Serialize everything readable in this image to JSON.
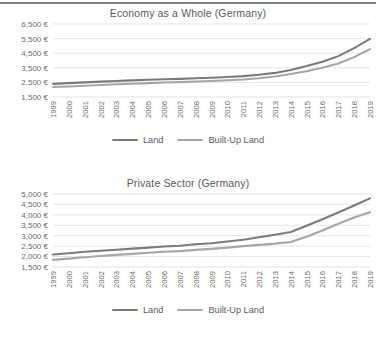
{
  "page": {
    "background": "#ffffff",
    "text_color": "#595959"
  },
  "colors": {
    "land": "#7b7b7b",
    "built_up_land": "#a6a6a6",
    "gridline": "#d9d9d9",
    "axis_text": "#6b6b6b",
    "rule": "#6f6f6f"
  },
  "charts": [
    {
      "id": "economy-as-a-whole",
      "title": "Economy as a Whole (Germany)",
      "legend": [
        {
          "label": "Land",
          "color": "#7b7b7b"
        },
        {
          "label": "Built-Up Land",
          "color": "#a6a6a6"
        }
      ]
    },
    {
      "id": "private-sector",
      "title": "Private Sector (Germany)",
      "legend": [
        {
          "label": "Land",
          "color": "#7b7b7b"
        },
        {
          "label": "Built-Up Land",
          "color": "#a6a6a6"
        }
      ]
    }
  ],
  "chart_data": [
    {
      "type": "line",
      "title": "Economy as a Whole (Germany)",
      "xlabel": "",
      "ylabel": "",
      "grid": true,
      "legend_position": "bottom",
      "ylim": [
        1500,
        6500
      ],
      "ytick_step": 1000,
      "ytick_labels": [
        "1,500 €",
        "2,500 €",
        "3,500 €",
        "4,500 €",
        "5,500 €",
        "6,500 €"
      ],
      "yticks": [
        1500,
        2500,
        3500,
        4500,
        5500,
        6500
      ],
      "categories": [
        1999,
        2000,
        2001,
        2002,
        2003,
        2004,
        2005,
        2006,
        2007,
        2008,
        2009,
        2010,
        2011,
        2012,
        2013,
        2014,
        2015,
        2016,
        2017,
        2018,
        2019
      ],
      "xtick_labels": [
        "1999",
        "2000",
        "2001",
        "2002",
        "2003",
        "2004",
        "2005",
        "2006",
        "2007",
        "2008",
        "2009",
        "2010",
        "2011",
        "2012",
        "2013",
        "2014",
        "2015",
        "2016",
        "2017",
        "2018",
        "2019"
      ],
      "series": [
        {
          "name": "Land",
          "color": "#7b7b7b",
          "values": [
            2400,
            2450,
            2500,
            2550,
            2600,
            2640,
            2680,
            2720,
            2740,
            2780,
            2820,
            2870,
            2930,
            3020,
            3150,
            3350,
            3620,
            3920,
            4300,
            4850,
            5480
          ]
        },
        {
          "name": "Built-Up Land",
          "color": "#a6a6a6",
          "values": [
            2180,
            2220,
            2270,
            2320,
            2370,
            2410,
            2450,
            2490,
            2520,
            2560,
            2600,
            2650,
            2700,
            2780,
            2900,
            3080,
            3260,
            3500,
            3800,
            4230,
            4780
          ]
        }
      ]
    },
    {
      "type": "line",
      "title": "Private Sector (Germany)",
      "xlabel": "",
      "ylabel": "",
      "grid": true,
      "legend_position": "bottom",
      "ylim": [
        1500,
        5000
      ],
      "ytick_step": 500,
      "ytick_labels": [
        "1,500 €",
        "2,000 €",
        "2,500 €",
        "3,000 €",
        "3,500 €",
        "4,000 €",
        "4,500 €",
        "5,000 €"
      ],
      "yticks": [
        1500,
        2000,
        2500,
        3000,
        3500,
        4000,
        4500,
        5000
      ],
      "categories": [
        1999,
        2000,
        2001,
        2002,
        2003,
        2004,
        2005,
        2006,
        2007,
        2008,
        2009,
        2010,
        2011,
        2012,
        2013,
        2014,
        2015,
        2016,
        2017,
        2018,
        2019
      ],
      "xtick_labels": [
        "1999",
        "2000",
        "2001",
        "2002",
        "2003",
        "2004",
        "2005",
        "2006",
        "2007",
        "2008",
        "2009",
        "2010",
        "2011",
        "2012",
        "2013",
        "2014",
        "2015",
        "2016",
        "2017",
        "2018",
        "2019"
      ],
      "series": [
        {
          "name": "Land",
          "color": "#7b7b7b",
          "values": [
            2100,
            2160,
            2230,
            2280,
            2330,
            2380,
            2430,
            2480,
            2520,
            2590,
            2640,
            2720,
            2810,
            2930,
            3050,
            3180,
            3480,
            3790,
            4110,
            4450,
            4790
          ]
        },
        {
          "name": "Built-Up Land",
          "color": "#a6a6a6",
          "values": [
            1840,
            1900,
            1970,
            2030,
            2080,
            2130,
            2180,
            2230,
            2260,
            2320,
            2370,
            2430,
            2500,
            2560,
            2620,
            2700,
            2950,
            3250,
            3570,
            3870,
            4130
          ]
        }
      ]
    }
  ]
}
